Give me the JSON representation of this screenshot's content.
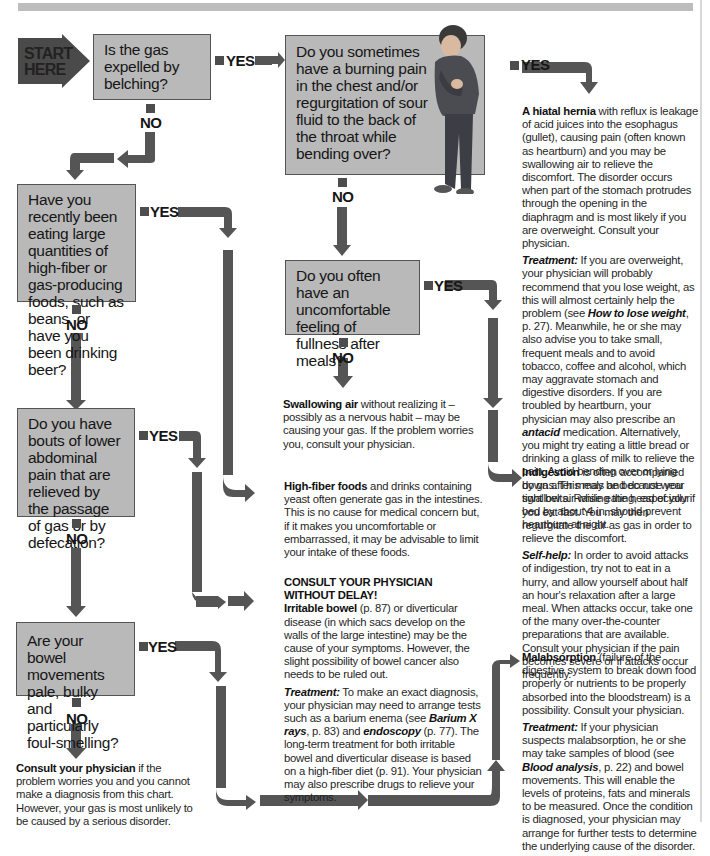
{
  "start": {
    "label_line1": "START",
    "label_line2": "HERE"
  },
  "labels": {
    "yes": "YES",
    "no": "NO"
  },
  "questions": {
    "q1": "Is the gas expelled by belching?",
    "q2": "Do you sometimes have a burning pain in the chest and/or regurgitation of sour fluid to the back of the throat while bending over?",
    "q3": "Have you recently been eating large quantities of high-fiber or gas-producing foods, such as beans, or have you been drinking beer?",
    "q4": "Do you often have an uncomfortable feeling of fullness after meals?",
    "q5": "Do you have bouts of lower abdominal pain that are relieved by the passage of gas or by defecation?",
    "q6": "Are your bowel movements pale, bulky and particularly foul-smelling?"
  },
  "outcomes": {
    "hiatal_hernia": {
      "title": "A hiatal hernia",
      "body": " with reflux is leakage of acid juices into the esophagus (gullet), causing pain (often known as heartburn) and you may be swallowing air to relieve the discomfort. The disorder occurs when part of the stomach protrudes through the opening in the diaphragm and is most likely if you are overweight. Consult your physician.",
      "treatment_label": "Treatment:",
      "treatment_a": " If you are overweight, your physician will probably recommend that you lose weight, as this will almost certainly help the problem (see ",
      "treatment_ref": "How to lose weight",
      "treatment_b": ", p. 27). Meanwhile, he or she may also advise you to take small, frequent meals and to avoid tobacco, coffee and alcohol, which may aggravate stomach and digestive disorders. If you are troubled by heartburn, your physician may also prescribe an ",
      "treatment_drug": "antacid",
      "treatment_c": " medication. Alternatively, you might try eating a little bread or drinking a glass of milk to relieve the pain. Avoid bending over or lying down after meals and do not wear tight belts. Raising the head of your bed by about 4 in. should prevent heartburn at night."
    },
    "swallowing_air": {
      "title": "Swallowing air",
      "body": " without realizing it – possibly as a nervous habit – may be causing your gas. If the problem worries you, consult your physician."
    },
    "indigestion": {
      "title": "Indigestion",
      "body": " is often accompanied by gas. This may be because you swallow air while eating, especially if you eat fast. You may then regurgitate the air as gas in order to relieve the discomfort.",
      "selfhelp_label": "Self-help:",
      "selfhelp": " In order to avoid attacks of indigestion, try not to eat in a hurry, and allow yourself about half an hour's relaxation after a large meal. When attacks occur, take one of the many over-the-counter preparations that are available. Consult your physician if the pain becomes severe or if attacks occur frequently."
    },
    "high_fiber": {
      "title": "High-fiber foods",
      "body": " and drinks containing yeast often generate gas in the intestines. This is no cause for medical concern but, if it makes you uncomfortable or embarrassed, it may be advisable to limit your intake of these foods."
    },
    "irritable_bowel": {
      "heading_line1": "CONSULT YOUR PHYSICIAN",
      "heading_line2": "WITHOUT DELAY!",
      "title": "Irritable bowel",
      "body": " (p. 87) or diverticular disease (in which sacs develop on the walls of the large intestine) may be the cause of your symptoms. However, the slight possibility of bowel cancer also needs to be ruled out.",
      "treatment_label": "Treatment:",
      "treatment_a": " To make an exact diagnosis, your physician may need to arrange tests such as a barium enema (see ",
      "treatment_ref1": "Barium X rays",
      "treatment_b": ", p. 83) and ",
      "treatment_ref2": "endoscopy",
      "treatment_c": " (p. 77). The long-term treatment for both irritable bowel and diverticular disease is based on a high-fiber diet (p. 91). Your physician may also prescribe drugs to relieve your symptoms."
    },
    "malabsorption": {
      "title": "Malabsorption",
      "body": " (failure of the digestive system to break down food properly or nutrients to be properly absorbed into the bloodstream) is a possibility. Consult your physician.",
      "treatment_label": "Treatment:",
      "treatment_a": " If your physician suspects malabsorption, he or she may take samples of blood (see ",
      "treatment_ref": "Blood analysis",
      "treatment_b": ", p. 22) and bowel movements. This will enable the levels of proteins, fats and minerals to be measured. Once the condition is diagnosed, your physician may arrange for further tests to determine the underlying cause of the disorder."
    },
    "consult": {
      "title": "Consult your physician",
      "body": " if the problem worries you and you cannot make a diagnosis from this chart. However, your gas is most unlikely to be caused by a serious disorder."
    }
  },
  "colors": {
    "box_fill": "#b9b9b9",
    "arrow": "#555555",
    "start": "#4a4a4a"
  }
}
